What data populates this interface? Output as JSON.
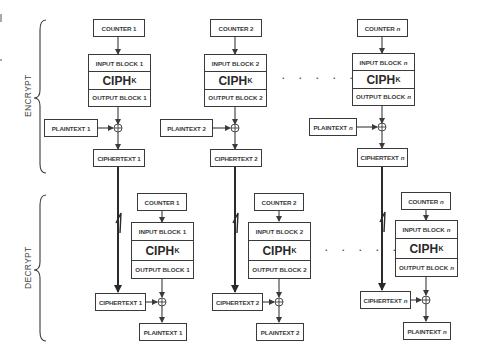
{
  "diagram": {
    "sections": [
      {
        "label": "ENCRYPT"
      },
      {
        "label": "DECRYPT"
      }
    ],
    "cipher_function": {
      "main": "CIPH",
      "subscript": "K"
    },
    "ellipsis": ". . . . .",
    "encrypt": {
      "columns": [
        {
          "counter": "COUNTER 1",
          "input": "INPUT BLOCK 1",
          "output": "OUTPUT BLOCK 1",
          "plaintext": "PLAINTEXT 1",
          "ciphertext": "CIPHERTEXT 1",
          "index": ""
        },
        {
          "counter": "COUNTER 2",
          "input": "INPUT BLOCK 2",
          "output": "OUTPUT BLOCK 2",
          "plaintext": "PLAINTEXT 2",
          "ciphertext": "CIPHERTEXT 2",
          "index": ""
        },
        {
          "counter": "COUNTER",
          "input": "INPUT BLOCK",
          "output": "OUTPUT BLOCK",
          "plaintext": "PLAINTEXT",
          "ciphertext": "CIPHERTEXT",
          "index": "n"
        }
      ]
    },
    "decrypt": {
      "columns": [
        {
          "counter": "COUNTER 1",
          "input": "INPUT BLOCK 1",
          "output": "OUTPUT BLOCK 1",
          "ciphertext": "CIPHERTEXT 1",
          "plaintext": "PLAINTEXT 1",
          "index": ""
        },
        {
          "counter": "COUNTER 2",
          "input": "INPUT BLOCK 2",
          "output": "OUTPUT BLOCK 2",
          "ciphertext": "CIPHERTEXT 2",
          "plaintext": "PLAINTEXT 2",
          "index": ""
        },
        {
          "counter": "COUNTER",
          "input": "INPUT BLOCK",
          "output": "OUTPUT BLOCK",
          "ciphertext": "CIPHERTEXT",
          "plaintext": "PLAINTEXT",
          "index": "n"
        }
      ]
    },
    "colors": {
      "stroke": "#3a3a3a",
      "text": "#3a3a3a",
      "background": "#ffffff"
    }
  }
}
